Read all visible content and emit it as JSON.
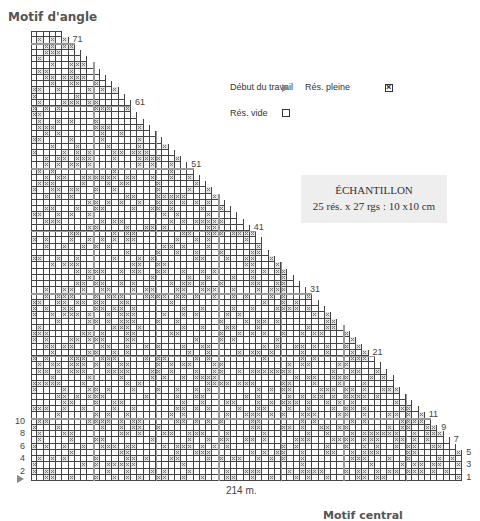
{
  "titles": {
    "corner": "Motif d'angle",
    "central": "Motif central"
  },
  "legend": {
    "start_label": "Début du travail",
    "start_icon": "triangle-arrow-icon",
    "full_label": "Rés. pleine",
    "full_icon": "crossed-box-icon",
    "empty_label": "Rés. vide",
    "empty_icon": "empty-box-icon"
  },
  "sample": {
    "title": "ÉCHANTILLON",
    "gauge": "25 rés. x 27 rgs : 10 x10 cm"
  },
  "grid": {
    "rows": 71,
    "columns": 69,
    "full_width_rows": 5,
    "top_row_cells": 5,
    "stitch_count_label": "214 m.",
    "left_row_labels": [
      "2",
      "4",
      "6",
      "8",
      "10"
    ],
    "right_row_labels": [
      "1",
      "3",
      "5",
      "7",
      "9",
      "11",
      "21",
      "31",
      "41",
      "51",
      "61",
      "71"
    ],
    "colors": {
      "line": "#444444",
      "major_line": "#999999",
      "filled": "#e6e6e6",
      "cross": "#777777"
    }
  }
}
